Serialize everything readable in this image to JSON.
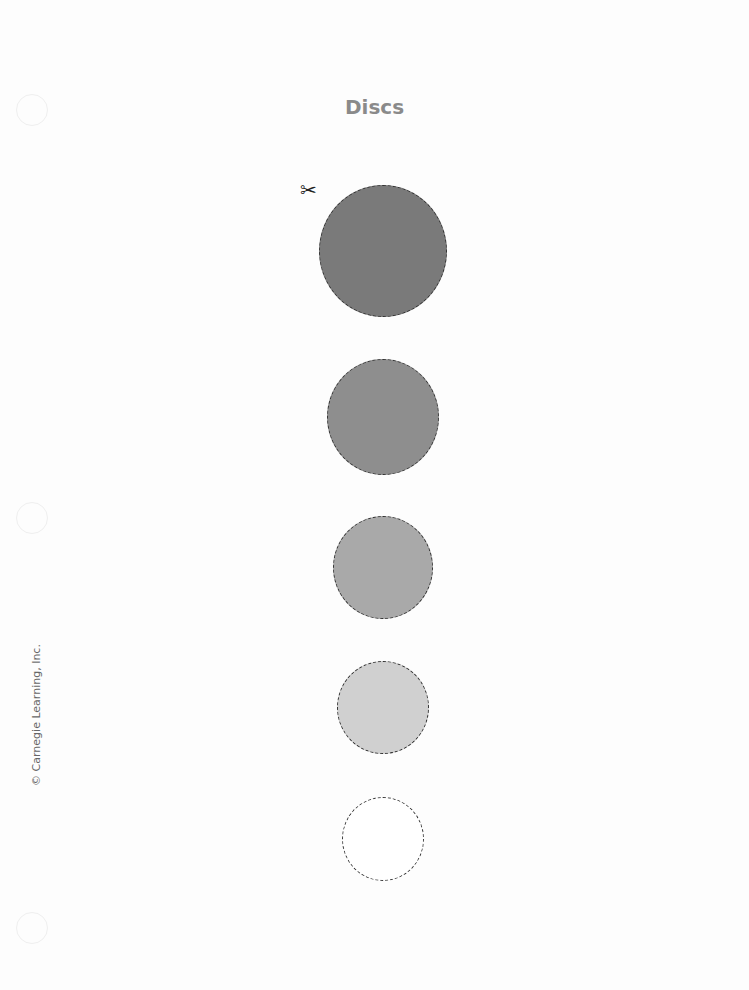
{
  "page": {
    "title": "Discs",
    "copyright": "© Carnegie Learning, Inc.",
    "scissors_icon": "✂"
  },
  "discs": [
    {
      "size": "largest",
      "color": "#7a7a7a"
    },
    {
      "size": "large",
      "color": "#8e8e8e"
    },
    {
      "size": "medium",
      "color": "#a9a9a9"
    },
    {
      "size": "small",
      "color": "#d0d0d0"
    },
    {
      "size": "smallest",
      "color": "#ffffff"
    }
  ]
}
